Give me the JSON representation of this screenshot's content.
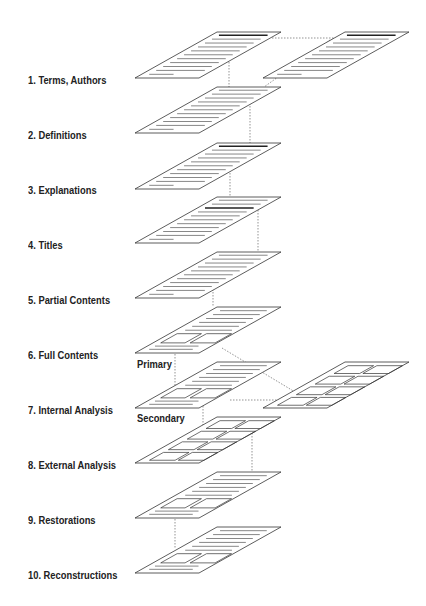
{
  "diagram": {
    "type": "layered-stack",
    "levels": [
      {
        "id": 1,
        "label": "1. Terms, Authors",
        "content": "text",
        "highlight_line": 0,
        "extra_panel": "right"
      },
      {
        "id": 2,
        "label": "2. Definitions",
        "content": "text"
      },
      {
        "id": 3,
        "label": "3. Explanations",
        "content": "text",
        "highlight_line": 0
      },
      {
        "id": 4,
        "label": "4. Titles",
        "content": "text",
        "highlight_line": 2
      },
      {
        "id": 5,
        "label": "5. Partial Contents",
        "content": "text"
      },
      {
        "id": 6,
        "label": "6. Full Contents",
        "content": "text+boxes"
      },
      {
        "id": 7,
        "label": "7. Internal Analysis",
        "content": "text+boxes",
        "extra_panel": "right-boxes"
      },
      {
        "id": 8,
        "label": "8. External Analysis",
        "content": "boxes"
      },
      {
        "id": 9,
        "label": "9. Restorations",
        "content": "text+boxes"
      },
      {
        "id": 10,
        "label": "10. Reconstructions",
        "content": "text+boxes"
      }
    ],
    "annotations": {
      "primary": "Primary",
      "secondary": "Secondary"
    },
    "colors": {
      "line": "#333333",
      "text_line": "#555555",
      "highlight": "#222222",
      "connector": "#666666"
    }
  }
}
